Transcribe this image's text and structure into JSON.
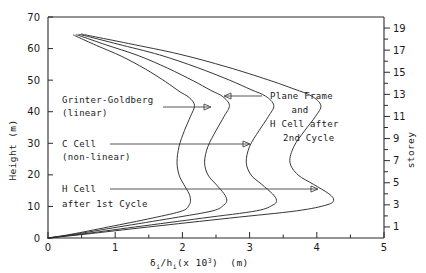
{
  "chart_data": {
    "type": "line",
    "title": "",
    "xlabel": "δi/hi  (x 103)  (m)",
    "ylabel": "Height (m)",
    "y2label": "storey",
    "xlim": [
      0,
      5
    ],
    "ylim": [
      0,
      70
    ],
    "y2lim": [
      0,
      20
    ],
    "grid": false,
    "legend_position": "inline-annotations",
    "xticks": [
      0,
      1,
      2,
      3,
      4,
      5
    ],
    "xticklabels": [
      "0",
      "1",
      "2",
      "3",
      "4",
      "5"
    ],
    "xminorticks": [
      0.5,
      1.5,
      2.5,
      3.5,
      4.5
    ],
    "yticks": [
      0,
      10,
      20,
      30,
      40,
      50,
      60,
      70
    ],
    "yticklabels": [
      "0",
      "10",
      "20",
      "30",
      "40",
      "50",
      "60",
      "70"
    ],
    "y2ticks": [
      1,
      2,
      3,
      4,
      5,
      6,
      7,
      8,
      9,
      10,
      11,
      12,
      13,
      14,
      15,
      16,
      17,
      18,
      19
    ],
    "y2ticklabels": [
      "1",
      "3",
      "5",
      "7",
      "9",
      "11",
      "13",
      "15",
      "17",
      "19"
    ],
    "y2labelled": [
      1,
      3,
      5,
      7,
      9,
      11,
      13,
      15,
      17,
      19
    ],
    "series": [
      {
        "name": "Grinter-Goldberg (linear)",
        "points": [
          [
            0.0,
            0.0
          ],
          [
            0.35,
            1.2
          ],
          [
            0.9,
            3.5
          ],
          [
            1.55,
            6.3
          ],
          [
            2.0,
            8.6
          ],
          [
            2.1,
            10.5
          ],
          [
            2.12,
            12.0
          ],
          [
            2.1,
            14.0
          ],
          [
            2.02,
            17.0
          ],
          [
            1.95,
            20.0
          ],
          [
            1.92,
            24.0
          ],
          [
            1.95,
            29.0
          ],
          [
            2.03,
            34.0
          ],
          [
            2.12,
            38.5
          ],
          [
            2.18,
            42.0
          ],
          [
            2.1,
            44.5
          ],
          [
            1.95,
            46.5
          ],
          [
            1.75,
            49.5
          ],
          [
            1.45,
            53.5
          ],
          [
            1.1,
            57.5
          ],
          [
            0.72,
            61.0
          ],
          [
            0.45,
            63.6
          ],
          [
            0.38,
            64.3
          ]
        ]
      },
      {
        "name": "C Cell (non-linear)",
        "points": [
          [
            0.0,
            0.0
          ],
          [
            0.4,
            1.2
          ],
          [
            1.05,
            3.5
          ],
          [
            1.85,
            6.3
          ],
          [
            2.45,
            8.6
          ],
          [
            2.62,
            10.5
          ],
          [
            2.66,
            12.0
          ],
          [
            2.62,
            14.0
          ],
          [
            2.5,
            17.0
          ],
          [
            2.38,
            20.0
          ],
          [
            2.33,
            24.0
          ],
          [
            2.38,
            29.0
          ],
          [
            2.5,
            34.0
          ],
          [
            2.62,
            38.5
          ],
          [
            2.7,
            42.0
          ],
          [
            2.6,
            44.8
          ],
          [
            2.42,
            46.8
          ],
          [
            2.16,
            49.8
          ],
          [
            1.78,
            53.8
          ],
          [
            1.34,
            57.8
          ],
          [
            0.86,
            61.2
          ],
          [
            0.52,
            63.7
          ],
          [
            0.42,
            64.4
          ]
        ]
      },
      {
        "name": "H Cell after 1st Cycle",
        "points": [
          [
            0.0,
            0.0
          ],
          [
            0.48,
            1.2
          ],
          [
            1.3,
            3.5
          ],
          [
            2.3,
            6.3
          ],
          [
            3.1,
            8.6
          ],
          [
            3.35,
            10.5
          ],
          [
            3.4,
            12.0
          ],
          [
            3.34,
            14.0
          ],
          [
            3.18,
            17.0
          ],
          [
            3.02,
            20.0
          ],
          [
            2.95,
            24.0
          ],
          [
            3.0,
            29.0
          ],
          [
            3.14,
            34.0
          ],
          [
            3.28,
            38.5
          ],
          [
            3.36,
            42.0
          ],
          [
            3.24,
            44.9
          ],
          [
            3.02,
            47.0
          ],
          [
            2.7,
            50.0
          ],
          [
            2.22,
            54.0
          ],
          [
            1.66,
            58.0
          ],
          [
            1.04,
            61.4
          ],
          [
            0.6,
            63.8
          ],
          [
            0.46,
            64.5
          ]
        ]
      },
      {
        "name": "Plane Frame and H Cell after 2nd Cycle",
        "points": [
          [
            0.0,
            0.0
          ],
          [
            0.55,
            1.2
          ],
          [
            1.5,
            3.5
          ],
          [
            2.7,
            6.3
          ],
          [
            3.7,
            8.6
          ],
          [
            4.15,
            10.5
          ],
          [
            4.25,
            12.0
          ],
          [
            4.18,
            14.0
          ],
          [
            3.95,
            17.0
          ],
          [
            3.72,
            20.0
          ],
          [
            3.6,
            24.0
          ],
          [
            3.66,
            29.0
          ],
          [
            3.82,
            34.0
          ],
          [
            3.98,
            38.5
          ],
          [
            4.06,
            42.0
          ],
          [
            3.92,
            45.0
          ],
          [
            3.66,
            47.2
          ],
          [
            3.26,
            50.2
          ],
          [
            2.66,
            54.2
          ],
          [
            1.96,
            58.2
          ],
          [
            1.2,
            61.6
          ],
          [
            0.66,
            63.9
          ],
          [
            0.5,
            64.6
          ]
        ]
      }
    ]
  },
  "axes": {
    "y_title": "Height  (m)",
    "y2_title": "storey",
    "x_title_delta": "δ",
    "x_title_sub1": "i",
    "x_title_slash_h": "/h",
    "x_title_sub2": "i",
    "x_title_paren": "(x 10",
    "x_title_sup": "3",
    "x_title_tail": ")  (m)"
  },
  "annotations": [
    {
      "id": "grinter-goldberg",
      "line1": "Grinter-Goldberg",
      "line2": "(linear)"
    },
    {
      "id": "c-cell",
      "line1": "C Cell",
      "line2": "(non-linear)"
    },
    {
      "id": "h-cell-1st",
      "line1": "H Cell",
      "line2": "after 1st Cycle"
    },
    {
      "id": "plane-frame",
      "line1": "Plane Frame",
      "line2": "and",
      "line3": "H Cell after",
      "line4": "2nd Cycle"
    }
  ]
}
